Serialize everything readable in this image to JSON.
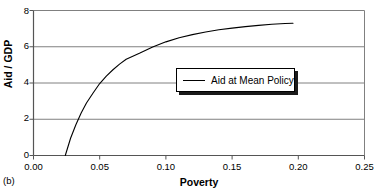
{
  "panel": {
    "label": "(b)"
  },
  "chart_data": {
    "type": "line",
    "title": "",
    "subtitle": "",
    "xlabel": "Poverty",
    "ylabel": "Aid / GDP",
    "xlim": [
      0.0,
      0.25
    ],
    "ylim": [
      0,
      8
    ],
    "xticks": [
      "0.00",
      "0.05",
      "0.10",
      "0.15",
      "0.20",
      "0.25"
    ],
    "xtick_values": [
      0.0,
      0.05,
      0.1,
      0.15,
      0.2,
      0.25
    ],
    "yticks": [
      "0",
      "2",
      "4",
      "6",
      "8"
    ],
    "ytick_values": [
      0,
      2,
      4,
      6,
      8
    ],
    "grid": "horizontal",
    "legend_position": "center",
    "series": [
      {
        "name": "Aid at Mean Policy",
        "color": "#000000",
        "x": [
          0.024,
          0.028,
          0.032,
          0.036,
          0.04,
          0.045,
          0.05,
          0.055,
          0.06,
          0.065,
          0.07,
          0.08,
          0.09,
          0.1,
          0.11,
          0.12,
          0.13,
          0.14,
          0.15,
          0.16,
          0.17,
          0.18,
          0.19,
          0.196
        ],
        "y": [
          0.0,
          0.95,
          1.7,
          2.35,
          2.9,
          3.45,
          3.97,
          4.38,
          4.73,
          5.04,
          5.31,
          5.64,
          5.99,
          6.27,
          6.5,
          6.67,
          6.81,
          6.94,
          7.03,
          7.11,
          7.18,
          7.24,
          7.28,
          7.3
        ]
      }
    ],
    "legend": [
      {
        "label": "Aid at Mean Policy",
        "color": "#000000",
        "marker": "line"
      }
    ]
  },
  "colors": {
    "axis": "#000000",
    "grid": "#808080",
    "curve": "#000000",
    "legend_border": "#000000",
    "legend_shadow": "#1a1a1a",
    "background": "#ffffff"
  }
}
